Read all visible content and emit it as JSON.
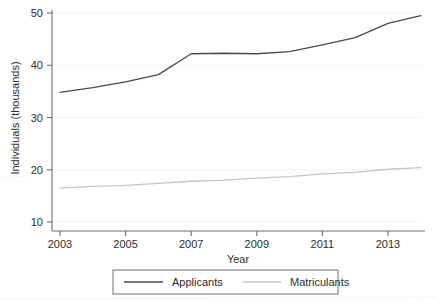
{
  "chart_data": {
    "type": "line",
    "title": "",
    "subtitle": "",
    "xlabel": "Year",
    "ylabel": "Individuals (thousands)",
    "xlim": [
      2003,
      2014.4
    ],
    "ylim": [
      10,
      50
    ],
    "xticks": [
      2003,
      2005,
      2007,
      2009,
      2011,
      2013
    ],
    "xticklabels": [
      "2003",
      "2005",
      "2007",
      "2009",
      "2011",
      "2013"
    ],
    "yticks": [
      10,
      20,
      30,
      40,
      50
    ],
    "yticklabels": [
      "10",
      "20",
      "30",
      "40",
      "50"
    ],
    "grid": "horizontal-faint",
    "legend_position": "bottom-outside",
    "x": [
      2003,
      2004,
      2005,
      2006,
      2007,
      2008,
      2009,
      2010,
      2011,
      2012,
      2013,
      2014
    ],
    "series": [
      {
        "name": "Applicants",
        "color": "#4a4a4a",
        "values": [
          34.8,
          35.7,
          36.8,
          38.2,
          42.2,
          42.3,
          42.2,
          42.6,
          43.9,
          45.3,
          48.0,
          49.5
        ]
      },
      {
        "name": "Matriculants",
        "color": "#c6c6c6",
        "values": [
          16.5,
          16.8,
          17.0,
          17.4,
          17.8,
          18.0,
          18.4,
          18.7,
          19.2,
          19.5,
          20.1,
          20.4
        ]
      }
    ],
    "annotations": []
  },
  "axes": {
    "y_title": "Individuals (thousands)",
    "x_title": "Year",
    "y_tick_labels": [
      "50",
      "40",
      "30",
      "20",
      "10"
    ],
    "x_tick_labels": [
      "2003",
      "2005",
      "2007",
      "2009",
      "2011",
      "2013"
    ]
  },
  "legend": {
    "items": [
      {
        "label": "Applicants",
        "color": "#4a4a4a"
      },
      {
        "label": "Matriculants",
        "color": "#c6c6c6"
      }
    ]
  },
  "colors": {
    "applicants_line": "#4a4a4a",
    "matriculants_line": "#c6c6c6",
    "axis": "#707070",
    "gridline": "#f2f2f2",
    "legend_border": "#6e6e6e",
    "background": "#ffffff"
  }
}
